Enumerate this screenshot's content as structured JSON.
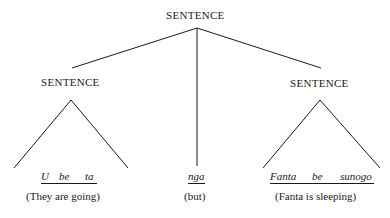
{
  "tree": {
    "root": {
      "label": "SENTENCE"
    },
    "left": {
      "label": "SENTENCE",
      "words": [
        "U",
        "be",
        "ta"
      ],
      "gloss": "(They are going)"
    },
    "middle": {
      "word": "nga",
      "gloss": "(but)"
    },
    "right": {
      "label": "SENTENCE",
      "words": [
        "Fanta",
        "be",
        "sunogo"
      ],
      "gloss": "(Fanta is sleeping)"
    }
  }
}
